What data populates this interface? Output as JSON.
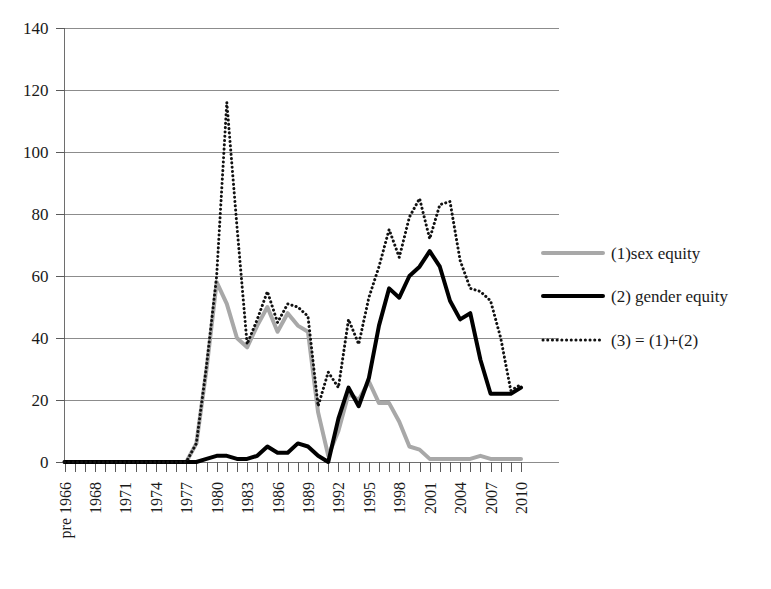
{
  "chart_data": {
    "type": "line",
    "title": "",
    "subtitle": "",
    "xlabel": "",
    "ylabel": "",
    "grid": true,
    "legend_position": "right",
    "ylim": [
      0,
      140
    ],
    "ytick_values": [
      0,
      20,
      40,
      60,
      80,
      100,
      120,
      140
    ],
    "ytick_labels": [
      "0",
      "20",
      "40",
      "60",
      "80",
      "100",
      "120",
      "140"
    ],
    "x": [
      "pre 1966",
      "1966",
      "1967",
      "1968",
      "1969",
      "1970",
      "1971",
      "1972",
      "1973",
      "1974",
      "1975",
      "1976",
      "1977",
      "1978",
      "1979",
      "1980",
      "1981",
      "1982",
      "1983",
      "1984",
      "1985",
      "1986",
      "1987",
      "1988",
      "1989",
      "1990",
      "1991",
      "1992",
      "1993",
      "1994",
      "1995",
      "1996",
      "1997",
      "1998",
      "1999",
      "2000",
      "2001",
      "2002",
      "2003",
      "2004",
      "2005",
      "2006",
      "2007",
      "2008",
      "2009",
      "2010"
    ],
    "xtick_labels_shown": [
      "pre 1966",
      "1968",
      "1971",
      "1974",
      "1977",
      "1980",
      "1983",
      "1986",
      "1989",
      "1992",
      "1995",
      "1998",
      "2001",
      "2004",
      "2007",
      "2010"
    ],
    "xtick_label_every": 3,
    "series": [
      {
        "name": "(1)sex equity",
        "style": "solid",
        "color": "#a8a8a8",
        "width": 4,
        "values": [
          0,
          0,
          0,
          0,
          0,
          0,
          0,
          0,
          0,
          0,
          0,
          0,
          0,
          6,
          30,
          58,
          51,
          40,
          37,
          44,
          50,
          42,
          48,
          44,
          42,
          16,
          2,
          10,
          22,
          20,
          26,
          19,
          19,
          13,
          5,
          4,
          1,
          1,
          1,
          1,
          1,
          2,
          1,
          1,
          1,
          1
        ]
      },
      {
        "name": "(2) gender equity",
        "style": "solid",
        "color": "#000000",
        "width": 4,
        "values": [
          0,
          0,
          0,
          0,
          0,
          0,
          0,
          0,
          0,
          0,
          0,
          0,
          0,
          0,
          1,
          2,
          2,
          1,
          1,
          2,
          5,
          3,
          3,
          6,
          5,
          2,
          0,
          14,
          24,
          18,
          27,
          44,
          56,
          53,
          60,
          63,
          68,
          63,
          52,
          46,
          48,
          33,
          22,
          22,
          22,
          24
        ]
      },
      {
        "name": "(3) = (1)+(2)",
        "style": "dotted",
        "color": "#111111",
        "width": 3,
        "values": [
          0,
          0,
          0,
          0,
          0,
          0,
          0,
          0,
          0,
          0,
          0,
          0,
          0,
          6,
          31,
          60,
          116,
          76,
          38,
          46,
          55,
          45,
          51,
          50,
          47,
          18,
          29,
          24,
          46,
          38,
          53,
          63,
          75,
          66,
          79,
          85,
          72,
          83,
          84,
          65,
          56,
          55,
          52,
          40,
          23,
          25
        ]
      }
    ],
    "note_series_alignment": {
      "sex_equity_rise_index": 13,
      "gender_equity_rise_index": 27,
      "total_peak_value": 116,
      "total_peak_x": "1981"
    }
  },
  "legend": {
    "items": [
      {
        "label": "(1)sex equity",
        "swatch": "solid-gray-line"
      },
      {
        "label": "(2) gender equity",
        "swatch": "solid-black-line"
      },
      {
        "label": "(3) = (1)+(2)",
        "swatch": "dotted-black-line"
      }
    ]
  },
  "colors": {
    "series1": "#a8a8a8",
    "series2": "#000000",
    "series3": "#111111",
    "grid": "#8c8c8c",
    "axis": "#6e6e6e",
    "background": "#ffffff"
  }
}
